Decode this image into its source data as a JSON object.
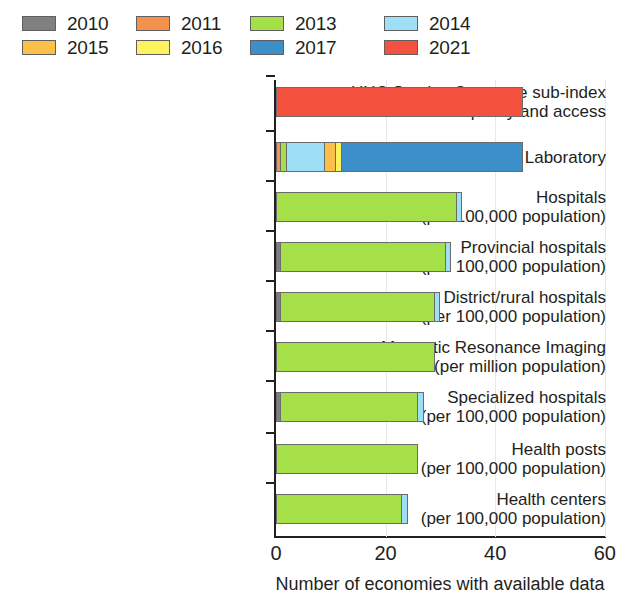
{
  "legend": {
    "items": [
      {
        "label": "2010",
        "color": "#808080"
      },
      {
        "label": "2011",
        "color": "#f4914e"
      },
      {
        "label": "2013",
        "color": "#a5e048"
      },
      {
        "label": "2014",
        "color": "#9fdff5"
      },
      {
        "label": "2015",
        "color": "#fbc04a"
      },
      {
        "label": "2016",
        "color": "#fdf35f"
      },
      {
        "label": "2017",
        "color": "#3d8fc9"
      },
      {
        "label": "2021",
        "color": "#f4513e"
      }
    ]
  },
  "axis": {
    "x_ticks": [
      "0",
      "20",
      "40",
      "60"
    ],
    "x_title": "Number of economies with available data"
  },
  "chart_data": {
    "type": "bar",
    "orientation": "horizontal",
    "stacked": true,
    "title": "",
    "xlabel": "Number of economies with available data",
    "ylabel": "",
    "xlim": [
      0,
      60
    ],
    "xticks": [
      0,
      20,
      40,
      60
    ],
    "grid": true,
    "legend_position": "top",
    "categories": [
      "UHC Service Coverage sub-index on service capacity and access",
      "Laboratory",
      "Hospitals (per 100,000 population)",
      "Provincial hospitals (per 100,000 population)",
      "District/rural hospitals (per 100,000 population)",
      "Magnetic Resonance Imaging (per million population)",
      "Specialized hospitals (per 100,000 population)",
      "Health posts (per 100,000 population)",
      "Health centers (per 100,000 population)"
    ],
    "category_lines": [
      [
        "UHC Service Coverage sub-index",
        "on service capacity and access"
      ],
      [
        "Laboratory",
        ""
      ],
      [
        "Hospitals",
        "(per 100,000 population)"
      ],
      [
        "Provincial hospitals",
        "(per 100,000 population)"
      ],
      [
        "District/rural hospitals",
        "(per 100,000 population)"
      ],
      [
        "Magnetic Resonance Imaging",
        "(per million population)"
      ],
      [
        "Specialized hospitals",
        "(per 100,000 population)"
      ],
      [
        "Health posts",
        "(per 100,000 population)"
      ],
      [
        "Health centers",
        "(per 100,000 population)"
      ]
    ],
    "series": [
      {
        "name": "2010",
        "color": "#808080",
        "values": [
          0,
          0,
          0,
          1,
          1,
          0,
          1,
          0,
          0
        ]
      },
      {
        "name": "2011",
        "color": "#f4914e",
        "values": [
          0,
          1,
          0,
          0,
          0,
          0,
          0,
          0,
          0
        ]
      },
      {
        "name": "2013",
        "color": "#a5e048",
        "values": [
          0,
          1,
          33,
          30,
          28,
          29,
          25,
          26,
          23
        ]
      },
      {
        "name": "2014",
        "color": "#9fdff5",
        "values": [
          0,
          7,
          1,
          1,
          1,
          0,
          1,
          0,
          1
        ]
      },
      {
        "name": "2015",
        "color": "#fbc04a",
        "values": [
          0,
          2,
          0,
          0,
          0,
          0,
          0,
          0,
          0
        ]
      },
      {
        "name": "2016",
        "color": "#fdf35f",
        "values": [
          0,
          1,
          0,
          0,
          0,
          0,
          0,
          0,
          0
        ]
      },
      {
        "name": "2017",
        "color": "#3d8fc9",
        "values": [
          0,
          33,
          0,
          0,
          0,
          0,
          0,
          0,
          0
        ]
      },
      {
        "name": "2021",
        "color": "#f4513e",
        "values": [
          45,
          0,
          0,
          0,
          0,
          0,
          0,
          0,
          0
        ]
      }
    ],
    "totals": [
      45,
      45,
      34,
      32,
      30,
      29,
      27,
      26,
      24
    ]
  }
}
